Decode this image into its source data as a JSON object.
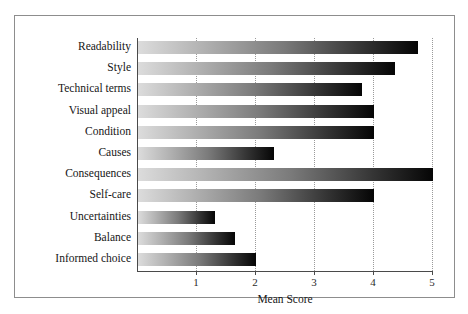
{
  "figure": {
    "top_clipped_caption": "· · · · · · · · · · · · · · · · · · · · · · · · · · · · · · · · · ·",
    "border_color": "#8d8d8d",
    "background": "#ffffff"
  },
  "chart_data": {
    "type": "bar",
    "orientation": "horizontal",
    "title": "",
    "subtitle": "",
    "xlabel": "Mean Score",
    "ylabel": "",
    "xlim": [
      0,
      5
    ],
    "ylim": [
      0,
      11
    ],
    "grid": true,
    "grid_axis": "x",
    "legend": false,
    "legend_position": "none",
    "xticks": [
      1,
      2,
      3,
      4,
      5
    ],
    "xticklabels": [
      "1",
      "2",
      "3",
      "4",
      "5"
    ],
    "categories": [
      "Readability",
      "Style",
      "Technical terms",
      "Visual appeal",
      "Condition",
      "Causes",
      "Consequences",
      "Self-care",
      "Uncertainties",
      "Balance",
      "Informed choice"
    ],
    "values": [
      4.75,
      4.35,
      3.8,
      4.0,
      4.0,
      2.3,
      5.0,
      4.0,
      1.3,
      1.65,
      2.0
    ],
    "bar_fill": "gradient-light-gray-to-black",
    "bar_gradient": {
      "from": "#dcdcdc",
      "to": "#050505",
      "direction": "left-to-right"
    },
    "axis_color": "#4a4a4a",
    "gridline_color": "#9a9a9a",
    "gridline_style": "dotted"
  }
}
